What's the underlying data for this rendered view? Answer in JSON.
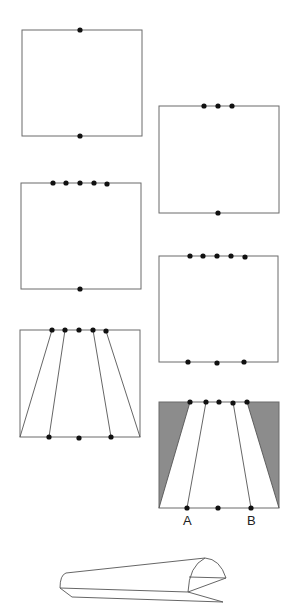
{
  "figure": {
    "colors": {
      "line": "#6b6b6b",
      "dot": "#111111",
      "shade": "#8c8c8c",
      "background": "#ffffff"
    },
    "steps": [
      {
        "id": 1,
        "top_dots": 1,
        "bottom_dots": 1
      },
      {
        "id": 2,
        "top_dots": 3,
        "bottom_dots": 1
      },
      {
        "id": 3,
        "top_dots": 5,
        "bottom_dots": 1
      },
      {
        "id": 4,
        "top_dots": 5,
        "bottom_dots": 3
      },
      {
        "id": 5,
        "top_dots": 5,
        "bottom_dots": 3,
        "fold_lines": 4
      },
      {
        "id": 6,
        "top_dots": 5,
        "bottom_dots": 3,
        "fold_lines": 2,
        "shaded_regions": 2
      }
    ],
    "labels": {
      "a": "A",
      "b": "B"
    },
    "final_shape": "folded-trough-3d"
  }
}
